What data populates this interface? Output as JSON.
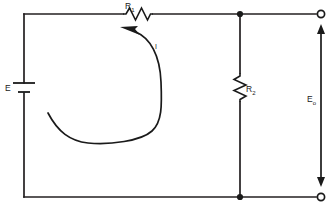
{
  "diagram": {
    "type": "schematic",
    "width": 334,
    "height": 210,
    "background_color": "#ffffff",
    "line_color": "#1a1a1a"
  },
  "labels": {
    "source": {
      "symbol": "E",
      "subscript": "i",
      "full": "E"
    },
    "resistor_1": {
      "symbol": "R",
      "subscript": "1",
      "full": "R1"
    },
    "resistor_2": {
      "symbol": "R",
      "subscript": "2",
      "full": "R2"
    },
    "output": {
      "symbol": "E",
      "subscript": "o",
      "full": "Eo"
    },
    "current": {
      "symbol": "I",
      "full": "I"
    }
  },
  "components": [
    {
      "name": "battery",
      "label": "E",
      "orientation": "vertical",
      "position": "left-branch"
    },
    {
      "name": "resistor-r1",
      "label": "R1",
      "orientation": "horizontal",
      "position": "top-branch"
    },
    {
      "name": "resistor-r2",
      "label": "R2",
      "orientation": "vertical",
      "position": "middle-branch"
    },
    {
      "name": "output-terminals",
      "label": "Eo",
      "orientation": "vertical",
      "position": "right-branch"
    }
  ],
  "nodes": [
    {
      "name": "junction-top",
      "x": 240,
      "y": 14,
      "style": "filled"
    },
    {
      "name": "junction-bottom",
      "x": 240,
      "y": 197,
      "style": "filled"
    },
    {
      "name": "terminal-top-right",
      "x": 322,
      "y": 14,
      "style": "open"
    },
    {
      "name": "terminal-bottom-right",
      "x": 322,
      "y": 197,
      "style": "open"
    }
  ],
  "annotations": [
    {
      "name": "current-loop-arrow",
      "label": "I",
      "direction": "counterclockwise"
    }
  ]
}
